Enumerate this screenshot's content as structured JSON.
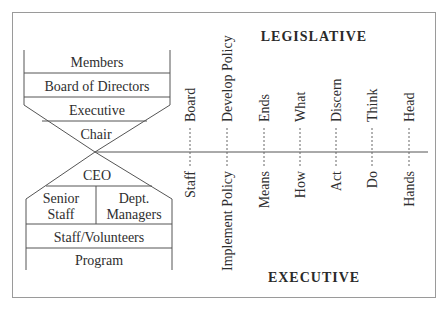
{
  "headers": {
    "top": "LEGISLATIVE",
    "bottom": "EXECUTIVE"
  },
  "hierarchy": {
    "top_block": [
      "Members",
      "Board of Directors",
      "Executive",
      "Chair"
    ],
    "bottom_block": {
      "apex": "CEO",
      "split_left": [
        "Senior",
        "Staff"
      ],
      "split_right": [
        "Dept.",
        "Managers"
      ],
      "rows": [
        "Staff/Volunteers",
        "Program"
      ]
    }
  },
  "pairs": [
    {
      "top": "Board",
      "bottom": "Staff"
    },
    {
      "top": "Develop Policy",
      "bottom": "Implement Policy"
    },
    {
      "top": "Ends",
      "bottom": "Means"
    },
    {
      "top": "What",
      "bottom": "How"
    },
    {
      "top": "Discern",
      "bottom": "Act"
    },
    {
      "top": "Think",
      "bottom": "Do"
    },
    {
      "top": "Head",
      "bottom": "Hands"
    }
  ],
  "colors": {
    "line": "#555555",
    "text": "#2e2e2e",
    "border": "#9a9a9a"
  }
}
